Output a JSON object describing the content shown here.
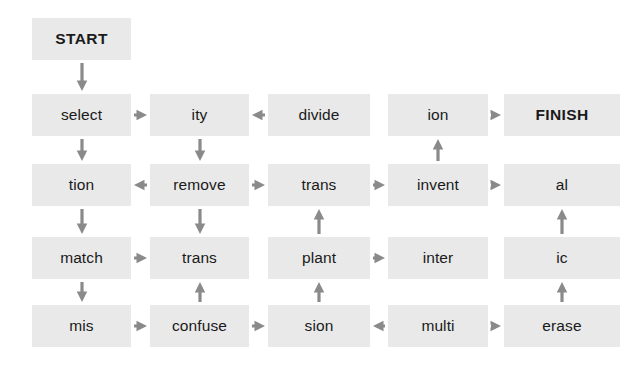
{
  "diagram": {
    "box_fill_color": "#e9e9e9",
    "text_color": "#1a1a1a",
    "arrow_color": "#8a8a8a",
    "background_color": "#ffffff",
    "columns": 5,
    "rows": 5,
    "nodes": [
      {
        "id": "start",
        "label": "START",
        "row": 1,
        "col": 1,
        "emphasis": "bold"
      },
      {
        "id": "select",
        "label": "select",
        "row": 2,
        "col": 1,
        "emphasis": "normal"
      },
      {
        "id": "ity",
        "label": "ity",
        "row": 2,
        "col": 2,
        "emphasis": "normal"
      },
      {
        "id": "divide",
        "label": "divide",
        "row": 2,
        "col": 3,
        "emphasis": "normal"
      },
      {
        "id": "ion",
        "label": "ion",
        "row": 2,
        "col": 4,
        "emphasis": "normal"
      },
      {
        "id": "finish",
        "label": "FINISH",
        "row": 2,
        "col": 5,
        "emphasis": "bold"
      },
      {
        "id": "tion",
        "label": "tion",
        "row": 3,
        "col": 1,
        "emphasis": "normal"
      },
      {
        "id": "remove",
        "label": "remove",
        "row": 3,
        "col": 2,
        "emphasis": "normal"
      },
      {
        "id": "trans1",
        "label": "trans",
        "row": 3,
        "col": 3,
        "emphasis": "normal"
      },
      {
        "id": "invent",
        "label": "invent",
        "row": 3,
        "col": 4,
        "emphasis": "normal"
      },
      {
        "id": "al",
        "label": "al",
        "row": 3,
        "col": 5,
        "emphasis": "normal"
      },
      {
        "id": "match",
        "label": "match",
        "row": 4,
        "col": 1,
        "emphasis": "normal"
      },
      {
        "id": "trans2",
        "label": "trans",
        "row": 4,
        "col": 2,
        "emphasis": "normal"
      },
      {
        "id": "plant",
        "label": "plant",
        "row": 4,
        "col": 3,
        "emphasis": "normal"
      },
      {
        "id": "inter",
        "label": "inter",
        "row": 4,
        "col": 4,
        "emphasis": "normal"
      },
      {
        "id": "ic",
        "label": "ic",
        "row": 4,
        "col": 5,
        "emphasis": "normal"
      },
      {
        "id": "mis",
        "label": "mis",
        "row": 5,
        "col": 1,
        "emphasis": "normal"
      },
      {
        "id": "confuse",
        "label": "confuse",
        "row": 5,
        "col": 2,
        "emphasis": "normal"
      },
      {
        "id": "sion",
        "label": "sion",
        "row": 5,
        "col": 3,
        "emphasis": "normal"
      },
      {
        "id": "multi",
        "label": "multi",
        "row": 5,
        "col": 4,
        "emphasis": "normal"
      },
      {
        "id": "erase",
        "label": "erase",
        "row": 5,
        "col": 5,
        "emphasis": "normal"
      }
    ],
    "arrows": [
      {
        "name": "arrow-start-to-select",
        "from": "start",
        "to": "select",
        "direction": "down"
      },
      {
        "name": "arrow-select-to-tion",
        "from": "select",
        "to": "tion",
        "direction": "down"
      },
      {
        "name": "arrow-tion-to-match",
        "from": "tion",
        "to": "match",
        "direction": "down"
      },
      {
        "name": "arrow-match-to-mis",
        "from": "match",
        "to": "mis",
        "direction": "down"
      },
      {
        "name": "arrow-select-to-ity",
        "from": "select",
        "to": "ity",
        "direction": "right"
      },
      {
        "name": "arrow-divide-to-ity",
        "from": "divide",
        "to": "ity",
        "direction": "left"
      },
      {
        "name": "arrow-ion-to-finish",
        "from": "ion",
        "to": "finish",
        "direction": "right"
      },
      {
        "name": "arrow-ity-to-remove",
        "from": "ity",
        "to": "remove",
        "direction": "down"
      },
      {
        "name": "arrow-remove-to-tion",
        "from": "remove",
        "to": "tion",
        "direction": "left"
      },
      {
        "name": "arrow-remove-to-trans",
        "from": "remove",
        "to": "trans1",
        "direction": "right"
      },
      {
        "name": "arrow-trans-to-invent",
        "from": "trans1",
        "to": "invent",
        "direction": "right"
      },
      {
        "name": "arrow-invent-to-al",
        "from": "invent",
        "to": "al",
        "direction": "right"
      },
      {
        "name": "arrow-invent-to-ion",
        "from": "invent",
        "to": "ion",
        "direction": "up"
      },
      {
        "name": "arrow-remove-to-trans2",
        "from": "remove",
        "to": "trans2",
        "direction": "down"
      },
      {
        "name": "arrow-match-to-trans2",
        "from": "match",
        "to": "trans2",
        "direction": "right"
      },
      {
        "name": "arrow-plant-to-trans",
        "from": "plant",
        "to": "trans1",
        "direction": "up"
      },
      {
        "name": "arrow-plant-to-inter",
        "from": "plant",
        "to": "inter",
        "direction": "right"
      },
      {
        "name": "arrow-ic-to-al",
        "from": "ic",
        "to": "al",
        "direction": "up"
      },
      {
        "name": "arrow-mis-to-confuse",
        "from": "mis",
        "to": "confuse",
        "direction": "right"
      },
      {
        "name": "arrow-confuse-to-trans2",
        "from": "confuse",
        "to": "trans2",
        "direction": "up"
      },
      {
        "name": "arrow-confuse-to-sion",
        "from": "confuse",
        "to": "sion",
        "direction": "right"
      },
      {
        "name": "arrow-sion-to-plant",
        "from": "sion",
        "to": "plant",
        "direction": "up"
      },
      {
        "name": "arrow-multi-to-sion",
        "from": "multi",
        "to": "sion",
        "direction": "left"
      },
      {
        "name": "arrow-multi-to-erase",
        "from": "multi",
        "to": "erase",
        "direction": "right"
      },
      {
        "name": "arrow-erase-to-ic",
        "from": "erase",
        "to": "ic",
        "direction": "up"
      }
    ]
  }
}
